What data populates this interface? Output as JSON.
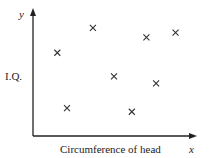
{
  "chart_data": {
    "type": "scatter",
    "title": "",
    "xlabel": "Circumference of head",
    "ylabel": "I.Q.",
    "x_axis_symbol": "x",
    "y_axis_symbol": "y",
    "marker": "x",
    "grid": false,
    "legend": null,
    "xlim": [
      0,
      10
    ],
    "ylim": [
      0,
      10
    ],
    "points": [
      {
        "x": 1.5,
        "y": 6.8
      },
      {
        "x": 3.7,
        "y": 8.9
      },
      {
        "x": 7.0,
        "y": 8.1
      },
      {
        "x": 8.8,
        "y": 8.5
      },
      {
        "x": 5.0,
        "y": 4.8
      },
      {
        "x": 7.6,
        "y": 4.2
      },
      {
        "x": 2.1,
        "y": 2.1
      },
      {
        "x": 6.1,
        "y": 1.8
      }
    ]
  },
  "colors": {
    "axis": "#222222",
    "marker": "#333333",
    "background": "#ffffff"
  }
}
